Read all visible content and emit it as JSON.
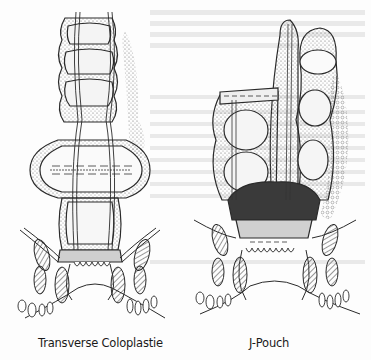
{
  "figure": {
    "panels": [
      {
        "id": "left",
        "caption": "Transverse Coloplastie",
        "depicts": "colon with transverse coloplasty pouch above anal sphincter"
      },
      {
        "id": "right",
        "caption": "J-Pouch",
        "depicts": "colonic J-pouch anastomosed above anal sphincter"
      }
    ],
    "colors": {
      "ink": "#2a2a2a",
      "paper": "#fdfdfd",
      "shading": "#8a8a8a"
    }
  }
}
